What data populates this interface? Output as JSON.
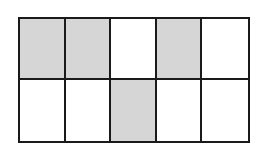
{
  "diagram": {
    "type": "fraction-grid",
    "rows": 2,
    "columns": 5,
    "total_cells": 10,
    "shaded_count": 4,
    "colors": {
      "shaded": "#d6d6d6",
      "unshaded": "#ffffff",
      "border": "#1a1a1a"
    },
    "cells": [
      [
        true,
        true,
        false,
        true,
        false
      ],
      [
        false,
        false,
        true,
        false,
        false
      ]
    ]
  }
}
